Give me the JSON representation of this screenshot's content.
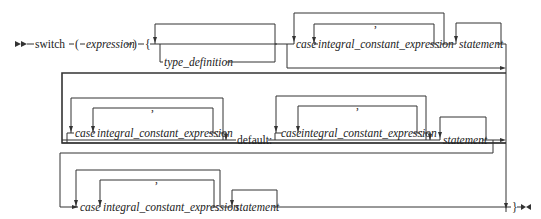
{
  "diagram": {
    "type": "syntax-railroad",
    "keyword": "switch",
    "open_paren": "(",
    "expression": "expression",
    "close_paren": ")",
    "open_brace": "{",
    "close_brace": "}",
    "type_definition": "type_definition",
    "case_kw": "case",
    "const_expr": "integral_constant_expression",
    "colon": ":",
    "comma": ",",
    "statement": "statement",
    "default_kw": "default:"
  }
}
